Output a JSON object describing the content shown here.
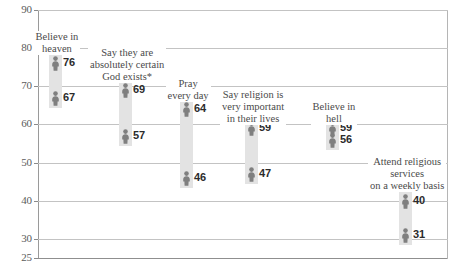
{
  "chart_data": {
    "type": "scatter",
    "title": "",
    "subtitle": "",
    "xlabel": "",
    "ylabel": "",
    "ylim": [
      25,
      90
    ],
    "grid": true,
    "legend_position": "none",
    "yticks": [
      90,
      80,
      70,
      60,
      50,
      40,
      30,
      25
    ],
    "categories": [
      "Believe in heaven",
      "Say they are absolutely certain God exists*",
      "Pray every day",
      "Say religion is very important in their lives",
      "Believe in hell",
      "Attend religious services on a weekly basis"
    ],
    "series": [
      {
        "name": "upper",
        "values": [
          76,
          69,
          64,
          59,
          59,
          40
        ]
      },
      {
        "name": "lower",
        "values": [
          67,
          57,
          46,
          47,
          56,
          31
        ]
      }
    ],
    "groups": [
      {
        "label_lines": [
          "Believe in",
          "heaven"
        ],
        "high": 76,
        "low": 67,
        "x": 55,
        "label_top": 31
      },
      {
        "label_lines": [
          "Say they are",
          "absolutely certain",
          "God exists*"
        ],
        "high": 69,
        "low": 57,
        "x": 125,
        "label_top": 47
      },
      {
        "label_lines": [
          "Pray",
          "every day"
        ],
        "high": 64,
        "low": 46,
        "x": 186,
        "label_top": 78
      },
      {
        "label_lines": [
          "Say religion is",
          "very important",
          "in their lives"
        ],
        "high": 59,
        "low": 47,
        "x": 251,
        "label_top": 89
      },
      {
        "label_lines": [
          "Believe in",
          "hell"
        ],
        "high": 59,
        "low": 56,
        "x": 332,
        "label_top": 101
      },
      {
        "label_lines": [
          "Attend religious",
          "services",
          "on a weekly basis"
        ],
        "high": 40,
        "low": 31,
        "x": 405,
        "label_top": 156
      }
    ]
  },
  "marker_color": "#7f7f7f",
  "band_color": "#e3e3e3",
  "grid_color": "#c3c3c3",
  "axis_color": "#8f8f8f"
}
